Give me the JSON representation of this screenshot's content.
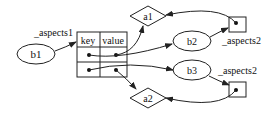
{
  "diagram": {
    "nodes": {
      "b1": {
        "label": "b1",
        "shape": "ellipse"
      },
      "b2": {
        "label": "b2",
        "shape": "ellipse"
      },
      "b3": {
        "label": "b3",
        "shape": "ellipse"
      },
      "a1": {
        "label": "a1",
        "shape": "diamond"
      },
      "a2": {
        "label": "a2",
        "shape": "diamond"
      },
      "table": {
        "shape": "table",
        "headers": [
          "key",
          "value"
        ],
        "rows": 2
      },
      "box1": {
        "shape": "box"
      },
      "box2": {
        "shape": "box"
      }
    },
    "edge_labels": {
      "b1_to_table": "_aspects1",
      "b2_to_box1": "_aspects2",
      "b3_to_box2": "_aspects2"
    },
    "edges": [
      {
        "from": "b1",
        "to": "table",
        "label": "_aspects1"
      },
      {
        "from": "table.row1.value",
        "to": "a1"
      },
      {
        "from": "table.row1.key",
        "to": "b2"
      },
      {
        "from": "table.row2.key",
        "to": "b3"
      },
      {
        "from": "table.row2.value",
        "to": "a2"
      },
      {
        "from": "b2",
        "to": "box1",
        "label": "_aspects2"
      },
      {
        "from": "box1",
        "to": "a1"
      },
      {
        "from": "b3",
        "to": "box2",
        "label": "_aspects2"
      },
      {
        "from": "box2",
        "to": "a2"
      }
    ],
    "colors": {
      "stroke": "#222222",
      "fill": "#ffffff"
    }
  }
}
